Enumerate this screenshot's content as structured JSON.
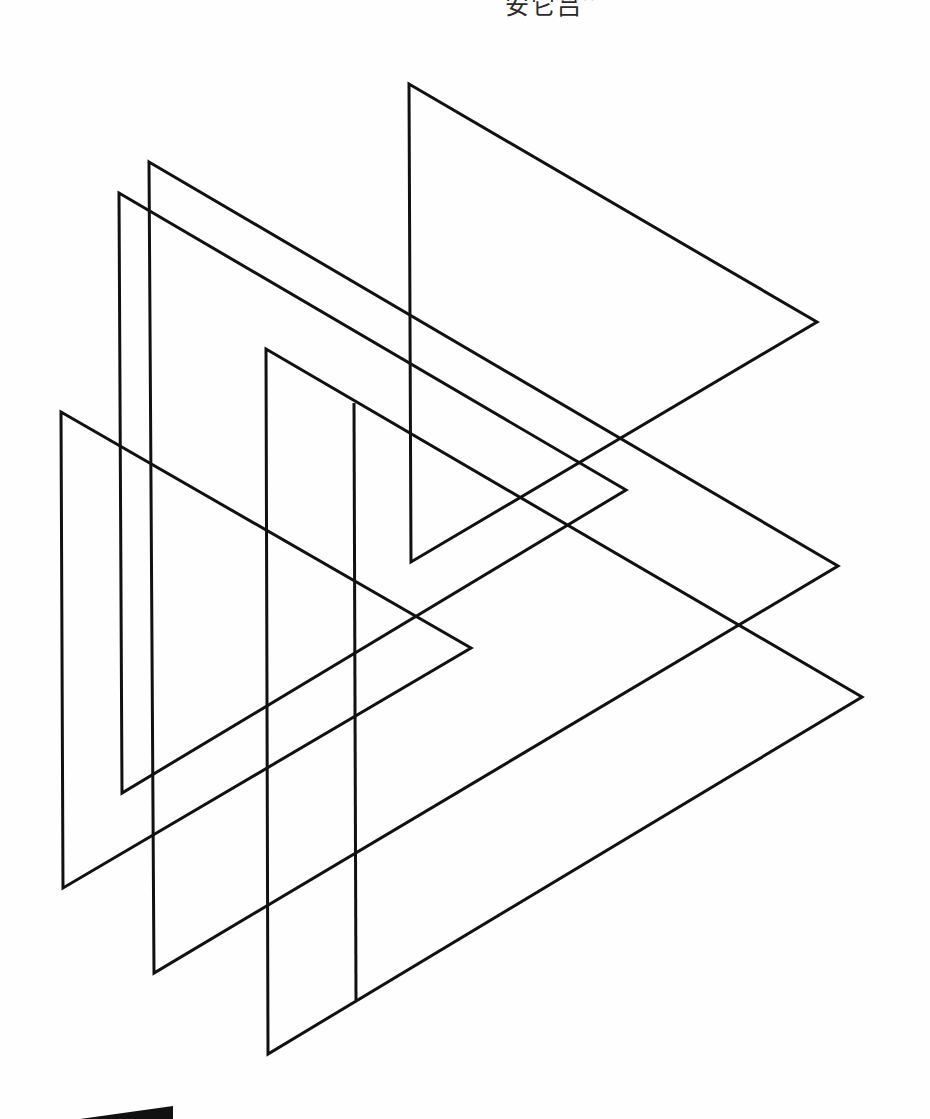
{
  "page": {
    "header_text": "安它吕",
    "header_faint_text": "· · · · ·",
    "background": "#fefefe",
    "stroke_color": "#111111",
    "stroke_width": 3
  },
  "drawing": {
    "description": "Overlapping outlined right-pointing triangles",
    "triangles": [
      {
        "name": "triangle-1",
        "points": "409,84 817,322 411,562"
      },
      {
        "name": "triangle-2",
        "points": "149,162 838,566 154,973"
      },
      {
        "name": "triangle-3",
        "points": "119,193 626,490 122,793"
      },
      {
        "name": "triangle-4",
        "points": "266,349 862,697 268,1054"
      },
      {
        "name": "triangle-5",
        "points": "61,412 471,648 63,888"
      }
    ],
    "segments": [
      {
        "name": "vertical-segment",
        "x1": 354,
        "y1": 403,
        "x2": 356,
        "y2": 1000
      }
    ],
    "corner_shape": {
      "name": "dark-wedge",
      "points": "80,1119 173,1106 173,1119",
      "fill": "#111111"
    }
  }
}
